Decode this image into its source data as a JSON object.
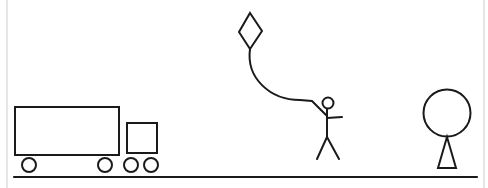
{
  "scene": {
    "title": "Line drawing: truck, person flying a kite, and figure with round head",
    "colors": {
      "stroke": "#1a1a1a",
      "border": "#dcdcdc",
      "background": "#ffffff"
    },
    "objects": [
      {
        "id": "truck",
        "label": "Truck"
      },
      {
        "id": "kite",
        "label": "Kite"
      },
      {
        "id": "kite-string",
        "label": "Kite string"
      },
      {
        "id": "stick-person",
        "label": "Stick person"
      },
      {
        "id": "round-figure",
        "label": "Figure with round head"
      },
      {
        "id": "ground",
        "label": "Ground line"
      }
    ]
  }
}
